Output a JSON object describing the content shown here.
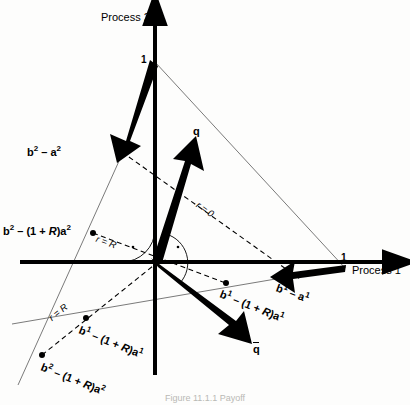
{
  "figure": {
    "caption": "Figure 11.1.1 Payoff",
    "bg_color": "#fdfdfc",
    "ink_color": "#000000",
    "thin_line_color": "#6b6b6b"
  },
  "axes": {
    "x_label": "Process 1",
    "y_label": "Process 2",
    "x_tick": "1",
    "y_tick": "1",
    "origin": {
      "x": 155,
      "y": 262
    }
  },
  "vectors": [
    {
      "name": "b2-minus-a2",
      "label_html": "b<sup>2</sup> − a<sup>2</sup>",
      "from": {
        "x": 155,
        "y": 62
      },
      "to": {
        "x": 122,
        "y": 152
      }
    },
    {
      "name": "q",
      "label_html": "q",
      "from": {
        "x": 155,
        "y": 262
      },
      "to": {
        "x": 197,
        "y": 143
      }
    },
    {
      "name": "q-bar",
      "label_html": "q̄",
      "from": {
        "x": 155,
        "y": 262
      },
      "to": {
        "x": 249,
        "y": 344
      }
    },
    {
      "name": "b1-minus-a1",
      "label_html": "b<sup>1</sup> − a<sup>1</sup>",
      "from": {
        "x": 345,
        "y": 268
      },
      "to": {
        "x": 278,
        "y": 282
      }
    }
  ],
  "labels": {
    "b2_minus_a2": "b2 − a2",
    "b2_minus_1pR_a2": "b2 − (1 + R)a2",
    "b1_minus_1pR_a1": "b1 − (1 + R)a1",
    "b2_minus_1pR_a2_lower": "b2 − (1 + R)a2",
    "b1_minus_a1": "b1 − a1",
    "q": "q",
    "q_bar": "q̄",
    "r_equals_0": "r = 0",
    "r_equals_R_upper": "r = R",
    "r_equals_R_lower": "r = R"
  },
  "points": [
    {
      "name": "b2-minus-1pR-a2-point",
      "x": 93,
      "y": 233
    },
    {
      "name": "b1-minus-1pR-a1-point",
      "x": 86,
      "y": 318
    },
    {
      "name": "b2-minus-1pR-a2-lower-point",
      "x": 42,
      "y": 355
    },
    {
      "name": "b1-minus-1pR-a1-right-point",
      "x": 226,
      "y": 283
    }
  ],
  "lines": {
    "r_equals_0_dashed": {
      "x1": 122,
      "y1": 152,
      "x2": 296,
      "y2": 277
    },
    "r_equals_R_dashed": {
      "x1": 93,
      "y1": 233,
      "x2": 226,
      "y2": 283
    },
    "r_equals_R_lower_dashed": {
      "x1": 42,
      "y1": 355,
      "x2": 155,
      "y2": 262
    },
    "thin_iso_1": {
      "x1": 155,
      "y1": 62,
      "x2": 345,
      "y2": 268
    },
    "thin_iso_2": {
      "x1": 122,
      "y1": 152,
      "x2": 20,
      "y2": 380
    },
    "thin_iso_3": {
      "x1": 14,
      "y1": 323,
      "x2": 345,
      "y2": 268
    }
  },
  "angles": [
    {
      "name": "angle-arc-upper-left",
      "radius": 33,
      "start_deg": 90,
      "end_deg": 172
    },
    {
      "name": "angle-arc-center",
      "radius": 30,
      "start_deg": 70,
      "end_deg": -20
    }
  ]
}
